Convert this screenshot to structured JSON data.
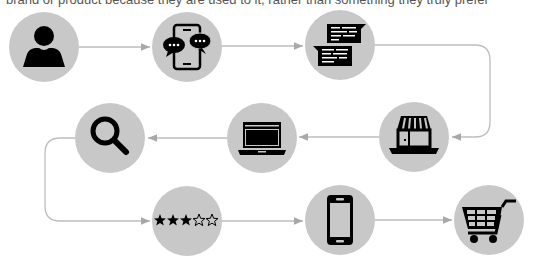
{
  "caption": "brand or product because they are used to it, rather than something they truly prefer",
  "colors": {
    "circle": "#c8c8c8",
    "icon": "#000000",
    "connector": "#b8b8b8",
    "background": "#ffffff"
  },
  "steps": [
    {
      "order": 1,
      "icon": "person-icon",
      "label": "Customer"
    },
    {
      "order": 2,
      "icon": "phone-chat-icon",
      "label": "Mobile conversation"
    },
    {
      "order": 3,
      "icon": "messages-icon",
      "label": "Messages"
    },
    {
      "order": 4,
      "icon": "storefront-icon",
      "label": "Store"
    },
    {
      "order": 5,
      "icon": "laptop-icon",
      "label": "Laptop browsing"
    },
    {
      "order": 6,
      "icon": "search-icon",
      "label": "Search"
    },
    {
      "order": 7,
      "icon": "star-rating-icon",
      "label": "Rating",
      "rating": 3,
      "max_rating": 5
    },
    {
      "order": 8,
      "icon": "smartphone-icon",
      "label": "Smartphone"
    },
    {
      "order": 9,
      "icon": "shopping-cart-icon",
      "label": "Purchase"
    }
  ]
}
